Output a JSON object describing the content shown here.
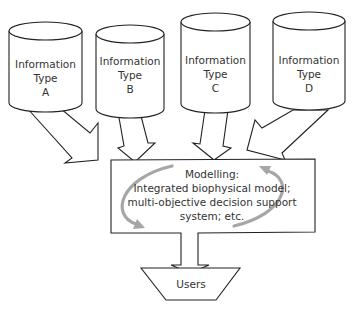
{
  "diagram": {
    "type": "flow",
    "sources": [
      {
        "id": "A",
        "lines": [
          "Information",
          "Type",
          "A"
        ]
      },
      {
        "id": "B",
        "lines": [
          "Information",
          "Type",
          "B"
        ]
      },
      {
        "id": "C",
        "lines": [
          "Information",
          "Type",
          "C"
        ]
      },
      {
        "id": "D",
        "lines": [
          "Information",
          "Type",
          "D"
        ]
      }
    ],
    "process": {
      "lines": [
        "Modelling:",
        "Integrated biophysical model;",
        "multi-objective decision support",
        "system; etc."
      ]
    },
    "output": {
      "label": "Users"
    },
    "edges": [
      {
        "from": "A",
        "to": "process"
      },
      {
        "from": "B",
        "to": "process"
      },
      {
        "from": "C",
        "to": "process"
      },
      {
        "from": "D",
        "to": "process"
      },
      {
        "from": "process",
        "to": "output"
      }
    ],
    "colors": {
      "stroke": "#222222",
      "text": "#333333",
      "cycle_arrows": "#a6a6a6",
      "background": "#ffffff"
    }
  }
}
